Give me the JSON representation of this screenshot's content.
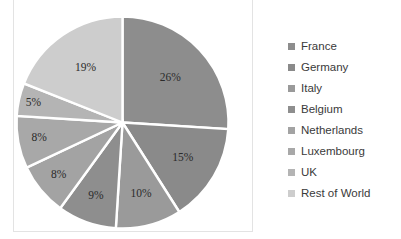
{
  "chart_data": {
    "type": "pie",
    "title": "",
    "categories": [
      "France",
      "Germany",
      "Italy",
      "Belgium",
      "Netherlands",
      "Luxembourg",
      "UK",
      "Rest of World"
    ],
    "values": [
      26,
      15,
      10,
      9,
      8,
      8,
      5,
      19
    ],
    "value_labels": [
      "26%",
      "15%",
      "10%",
      "9%",
      "8%",
      "8%",
      "5%",
      "19%"
    ],
    "units": "percent",
    "total": 100,
    "start_angle_deg": 0,
    "direction": "clockwise",
    "legend_position": "right",
    "grid": false,
    "slice_colors": [
      "#8d8d8d",
      "#8a8a8a",
      "#9a9a9a",
      "#8e8e8e",
      "#a3a3a3",
      "#a8a8a8",
      "#b4b4b4",
      "#cdcdcd"
    ],
    "separator_color": "#ffffff",
    "plot_border_color": "#e3e3e3"
  },
  "legend": {
    "items": [
      {
        "label": "France",
        "color": "#8d8d8d"
      },
      {
        "label": "Germany",
        "color": "#8a8a8a"
      },
      {
        "label": "Italy",
        "color": "#9a9a9a"
      },
      {
        "label": "Belgium",
        "color": "#8e8e8e"
      },
      {
        "label": "Netherlands",
        "color": "#a3a3a3"
      },
      {
        "label": "Luxembourg",
        "color": "#a8a8a8"
      },
      {
        "label": "UK",
        "color": "#b4b4b4"
      },
      {
        "label": "Rest of World",
        "color": "#cdcdcd"
      }
    ]
  }
}
